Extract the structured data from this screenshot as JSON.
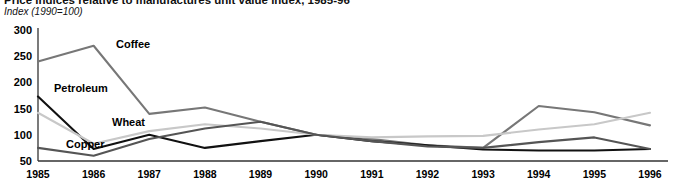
{
  "header": {
    "title": "Price indices relative to manufactures unit value index, 1985-96",
    "subtitle": "Index (1990=100)"
  },
  "axes": {
    "y_ticks": [
      "300",
      "250",
      "200",
      "150",
      "100",
      "50"
    ],
    "x_ticks": [
      "1985",
      "1986",
      "1987",
      "1988",
      "1989",
      "1990",
      "1991",
      "1992",
      "1993",
      "1994",
      "1995",
      "1996"
    ]
  },
  "series_labels": {
    "coffee": "Coffee",
    "petroleum": "Petroleum",
    "wheat": "Wheat",
    "copper": "Copper"
  },
  "colors": {
    "coffee": "#777777",
    "petroleum": "#111111",
    "wheat": "#c8c8c8",
    "copper": "#555555",
    "axis": "#333333",
    "background": "#ffffff"
  },
  "chart_data": {
    "type": "line",
    "title": "Price indices relative to manufactures unit value index, 1985-96",
    "subtitle": "Index (1990=100)",
    "xlabel": "",
    "ylabel": "Index (1990=100)",
    "x": [
      1985,
      1986,
      1987,
      1988,
      1989,
      1990,
      1991,
      1992,
      1993,
      1994,
      1995,
      1996
    ],
    "categories": [
      "1985",
      "1986",
      "1987",
      "1988",
      "1989",
      "1990",
      "1991",
      "1992",
      "1993",
      "1994",
      "1995",
      "1996"
    ],
    "ylim": [
      50,
      300
    ],
    "xlim": [
      1985,
      1996
    ],
    "grid": false,
    "legend": "inline-labels",
    "series": [
      {
        "name": "Coffee",
        "color": "#777777",
        "values": [
          240,
          270,
          140,
          152,
          125,
          100,
          92,
          80,
          75,
          155,
          143,
          118
        ]
      },
      {
        "name": "Petroleum",
        "color": "#111111",
        "values": [
          173,
          73,
          100,
          75,
          88,
          100,
          88,
          80,
          72,
          70,
          70,
          73
        ]
      },
      {
        "name": "Wheat",
        "color": "#c8c8c8",
        "values": [
          142,
          83,
          107,
          120,
          112,
          100,
          95,
          97,
          98,
          110,
          120,
          142
        ]
      },
      {
        "name": "Copper",
        "color": "#555555",
        "values": [
          75,
          60,
          92,
          112,
          125,
          100,
          88,
          78,
          75,
          86,
          95,
          73
        ]
      }
    ]
  }
}
